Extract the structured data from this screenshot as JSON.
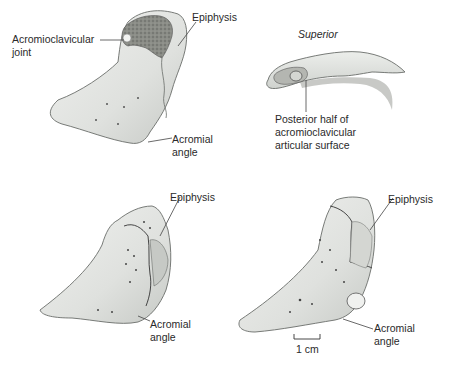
{
  "figure": {
    "panels": [
      {
        "id": "top-left",
        "labels": {
          "joint_line1": "Acromioclavicular",
          "joint_line2": "joint",
          "epiphysis": "Epiphysis",
          "angle_line1": "Acromial",
          "angle_line2": "angle"
        }
      },
      {
        "id": "top-right",
        "view": "Superior",
        "labels": {
          "surface_line1": "Posterior half of",
          "surface_line2": "acromioclavicular",
          "surface_line3": "articular surface"
        }
      },
      {
        "id": "bottom-left",
        "labels": {
          "epiphysis": "Epiphysis",
          "angle_line1": "Acromial",
          "angle_line2": "angle"
        }
      },
      {
        "id": "bottom-right",
        "labels": {
          "epiphysis": "Epiphysis",
          "angle_line1": "Acromial",
          "angle_line2": "angle"
        },
        "scale_bar": "1 cm"
      }
    ],
    "colors": {
      "bone_fill": "#e4e6e4",
      "bone_shade": "#c9ccc9",
      "bone_outline": "#6a6d6a",
      "articular_fill": "#7d7f7a",
      "leader_line": "#444444"
    }
  }
}
